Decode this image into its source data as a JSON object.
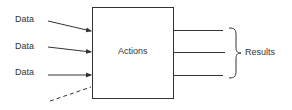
{
  "diagram": {
    "inputs": [
      {
        "label": "Data"
      },
      {
        "label": "Data"
      },
      {
        "label": "Data"
      }
    ],
    "process": {
      "label": "Actions"
    },
    "output": {
      "label": "Results",
      "count": 3
    },
    "colors": {
      "stroke": "#333333",
      "text": "#333333",
      "background": "#ffffff"
    }
  }
}
